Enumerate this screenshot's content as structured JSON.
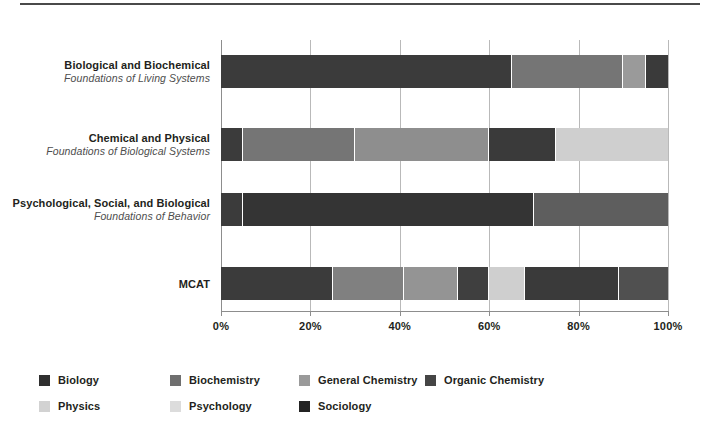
{
  "chart_data": {
    "type": "bar",
    "orientation": "horizontal",
    "stacked": true,
    "stacked_mode": "percent",
    "title": "",
    "xlabel": "",
    "ylabel": "",
    "xlim": [
      0,
      100
    ],
    "grid": true,
    "legend_position": "bottom",
    "xticks": [
      "0%",
      "20%",
      "40%",
      "60%",
      "80%",
      "100%"
    ],
    "xtick_values": [
      0,
      20,
      40,
      60,
      80,
      100
    ],
    "categories": [
      {
        "title": "Biological and Biochemical",
        "subtitle": "Foundations of Living Systems"
      },
      {
        "title": "Chemical and Physical",
        "subtitle": "Foundations of Biological Systems"
      },
      {
        "title": "Psychological, Social, and Biological",
        "subtitle": "Foundations of Behavior"
      },
      {
        "title": "MCAT",
        "subtitle": ""
      }
    ],
    "series": [
      {
        "name": "Biology",
        "color": "#3b3b3b",
        "values": [
          65,
          5,
          5,
          25
        ]
      },
      {
        "name": "Biochemistry",
        "color": "#757575",
        "values": [
          25,
          25,
          0,
          16
        ]
      },
      {
        "name": "General Chemistry",
        "color": "#9a9a9a",
        "values": [
          5,
          30,
          0,
          12
        ]
      },
      {
        "name": "Organic Chemistry",
        "color": "#454545",
        "values": [
          5,
          15,
          0,
          7
        ]
      },
      {
        "name": "Physics",
        "color": "#cfcfcf",
        "values": [
          0,
          25,
          0,
          8
        ]
      },
      {
        "name": "Psychology",
        "color": "#d9d9d9",
        "values": [
          0,
          0,
          65,
          21
        ]
      },
      {
        "name": "Sociology",
        "color": "#2b2b2b",
        "values": [
          0,
          0,
          30,
          11
        ]
      }
    ],
    "bars": [
      {
        "category": "Biological and Biochemical",
        "segments": [
          {
            "name": "Biology",
            "value": 65,
            "color": "#3b3b3b"
          },
          {
            "name": "Biochemistry",
            "value": 25,
            "color": "#757575"
          },
          {
            "name": "General Chemistry",
            "value": 5,
            "color": "#9a9a9a"
          },
          {
            "name": "Organic Chemistry",
            "value": 5,
            "color": "#3a3a3a"
          }
        ]
      },
      {
        "category": "Chemical and Physical",
        "segments": [
          {
            "name": "Biology",
            "value": 5,
            "color": "#3b3b3b"
          },
          {
            "name": "Biochemistry",
            "value": 25,
            "color": "#757575"
          },
          {
            "name": "General Chemistry",
            "value": 30,
            "color": "#8e8e8e"
          },
          {
            "name": "Organic Chemistry",
            "value": 15,
            "color": "#3a3a3a"
          },
          {
            "name": "Physics",
            "value": 25,
            "color": "#cfcfcf"
          }
        ]
      },
      {
        "category": "Psychological, Social, and Biological",
        "segments": [
          {
            "name": "Biology",
            "value": 5,
            "color": "#3b3b3b"
          },
          {
            "name": "Psychology",
            "value": 65,
            "color": "#343434"
          },
          {
            "name": "Sociology",
            "value": 30,
            "color": "#5e5e5e"
          }
        ]
      },
      {
        "category": "MCAT",
        "segments": [
          {
            "name": "Biology",
            "value": 25,
            "color": "#3b3b3b"
          },
          {
            "name": "Biochemistry",
            "value": 16,
            "color": "#808080"
          },
          {
            "name": "General Chemistry",
            "value": 12,
            "color": "#949494"
          },
          {
            "name": "Organic Chemistry",
            "value": 7,
            "color": "#3f3f3f"
          },
          {
            "name": "Physics",
            "value": 8,
            "color": "#cfcfcf"
          },
          {
            "name": "Psychology",
            "value": 21,
            "color": "#3a3a3a"
          },
          {
            "name": "Sociology",
            "value": 11,
            "color": "#505050"
          }
        ]
      }
    ],
    "legend": [
      {
        "label": "Biology",
        "color": "#2f2f2f"
      },
      {
        "label": "Biochemistry",
        "color": "#6f6f6f"
      },
      {
        "label": "General Chemistry",
        "color": "#9a9a9a"
      },
      {
        "label": "Organic Chemistry",
        "color": "#454545"
      },
      {
        "label": "Physics",
        "color": "#d2d2d2"
      },
      {
        "label": "Psychology",
        "color": "#dcdcdc"
      },
      {
        "label": "Sociology",
        "color": "#232323"
      }
    ]
  }
}
